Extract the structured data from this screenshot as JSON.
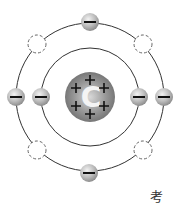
{
  "diagram": {
    "nucleus": {
      "symbol": "C",
      "charges": [
        "+",
        "+",
        "+",
        "+",
        "+",
        "+"
      ]
    },
    "shells": [
      {
        "name": "inner",
        "electrons": 2
      },
      {
        "name": "outer",
        "electrons": 4,
        "empty_slots": 4
      }
    ],
    "electron_symbol": "−",
    "watermark": "考"
  },
  "colors": {
    "orbit": "#333333",
    "electron": "#b5b5b5",
    "nucleus": "#8a8a8a",
    "symbol": "#ffffff"
  }
}
